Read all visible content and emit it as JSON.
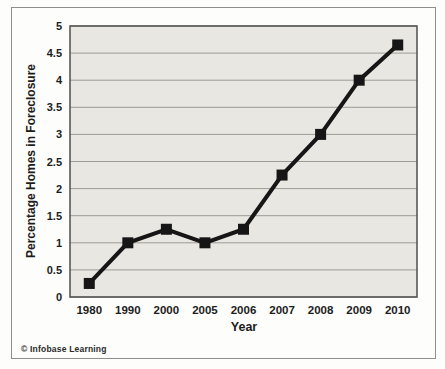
{
  "frame": {
    "copyright": "© Infobase Learning"
  },
  "chart_data": {
    "type": "line",
    "title": "",
    "xlabel": "Year",
    "ylabel": "Percentage Homes in Foreclosure",
    "categories": [
      "1980",
      "1990",
      "2000",
      "2005",
      "2006",
      "2007",
      "2008",
      "2009",
      "2010"
    ],
    "series": [
      {
        "name": "Percentage Homes in Foreclosure",
        "values": [
          0.25,
          1.0,
          1.25,
          1.0,
          1.25,
          2.25,
          3.0,
          4.0,
          4.65
        ]
      }
    ],
    "ylim": [
      0,
      5
    ],
    "yticks": [
      0,
      0.5,
      1,
      1.5,
      2,
      2.5,
      3,
      3.5,
      4,
      4.5,
      5
    ],
    "grid": "horizontal",
    "legend": "none",
    "marker": "square",
    "colors": {
      "line": "#161616",
      "marker": "#161616",
      "plot_background": "#e9e7e1",
      "gridline": "#9c9c96",
      "plot_border": "#4f4f4f",
      "text": "#1c1c1c",
      "frame_border": "#8e8e8e",
      "page_background": "#fdfdfb"
    }
  }
}
